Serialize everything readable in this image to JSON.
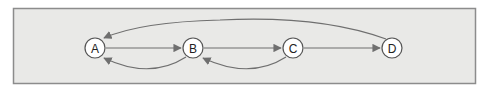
{
  "diagram": {
    "type": "state-graph",
    "colors": {
      "background": "#e9e9e7",
      "border": "#8c8c8c",
      "edge": "#6f6f6f",
      "node_fill": "#ffffff",
      "node_stroke": "#555555"
    },
    "nodes": [
      {
        "id": "A",
        "label": "A"
      },
      {
        "id": "B",
        "label": "B"
      },
      {
        "id": "C",
        "label": "C"
      },
      {
        "id": "D",
        "label": "D"
      }
    ],
    "edges": [
      {
        "from": "A",
        "to": "B",
        "style": "straight"
      },
      {
        "from": "B",
        "to": "C",
        "style": "straight"
      },
      {
        "from": "C",
        "to": "D",
        "style": "straight"
      },
      {
        "from": "B",
        "to": "A",
        "style": "curved-below"
      },
      {
        "from": "C",
        "to": "B",
        "style": "curved-below"
      },
      {
        "from": "D",
        "to": "A",
        "style": "curved-above"
      }
    ]
  }
}
